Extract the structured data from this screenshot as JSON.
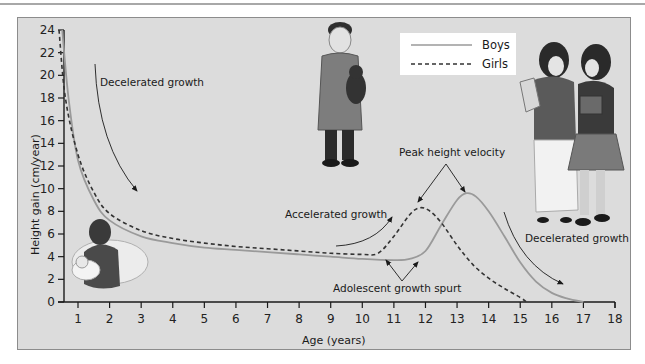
{
  "chart_data": {
    "type": "line",
    "title": "",
    "xlabel": "Age (years)",
    "ylabel": "Height gain (cm/year)",
    "xlim": [
      0.5,
      18
    ],
    "ylim": [
      0,
      24
    ],
    "x_ticks": [
      1,
      2,
      3,
      4,
      5,
      6,
      7,
      8,
      9,
      10,
      11,
      12,
      13,
      14,
      15,
      16,
      17,
      18
    ],
    "y_ticks": [
      0,
      2,
      4,
      6,
      8,
      10,
      12,
      14,
      16,
      18,
      20,
      22,
      24
    ],
    "grid": false,
    "legend": {
      "position": "upper-right-center",
      "entries": [
        {
          "label": "Boys",
          "style": "solid",
          "color": "#9a9a9a"
        },
        {
          "label": "Girls",
          "style": "dashed",
          "color": "#333333"
        }
      ]
    },
    "series": [
      {
        "name": "Boys",
        "style": "solid",
        "x": [
          0.5,
          0.7,
          1.0,
          1.5,
          2.0,
          3.0,
          4.0,
          5.0,
          6.0,
          7.0,
          8.0,
          9.0,
          10.0,
          11.0,
          11.5,
          12.0,
          12.5,
          13.0,
          13.3,
          13.6,
          14.0,
          14.5,
          15.0,
          15.5,
          16.0,
          16.5,
          17.0
        ],
        "y": [
          24,
          18,
          12.5,
          9.0,
          7.2,
          5.8,
          5.2,
          4.8,
          4.6,
          4.4,
          4.2,
          4.0,
          3.8,
          3.7,
          3.8,
          4.5,
          6.8,
          9.0,
          9.6,
          9.3,
          8.0,
          5.8,
          3.5,
          1.8,
          0.8,
          0.3,
          0.0
        ]
      },
      {
        "name": "Girls",
        "style": "dashed",
        "x": [
          0.4,
          0.6,
          1.0,
          1.5,
          2.0,
          3.0,
          4.0,
          5.0,
          6.0,
          7.0,
          8.0,
          9.0,
          10.0,
          10.5,
          11.0,
          11.5,
          11.8,
          12.1,
          12.5,
          13.0,
          13.5,
          14.0,
          14.5,
          15.0,
          15.2
        ],
        "y": [
          24,
          18,
          13.0,
          9.7,
          7.8,
          6.3,
          5.6,
          5.2,
          4.9,
          4.7,
          4.5,
          4.3,
          4.2,
          4.3,
          5.8,
          7.7,
          8.3,
          8.1,
          7.0,
          5.0,
          3.3,
          2.1,
          1.2,
          0.4,
          0.0
        ]
      }
    ],
    "annotations": [
      {
        "text": "Decelerated growth",
        "x": 1.7,
        "y": 20
      },
      {
        "text": "Accelerated growth",
        "x": 9.8,
        "y": 6.5
      },
      {
        "text": "Peak height velocity",
        "x": 11.7,
        "y": 10.5
      },
      {
        "text": "Adolescent growth spurt",
        "x": 10.0,
        "y": 1.2
      },
      {
        "text": "Decelerated growth",
        "x": 14.8,
        "y": 4.2
      }
    ]
  },
  "labels": {
    "xlabel": "Age (years)",
    "ylabel": "Height gain (cm/year)",
    "legend_boys": "Boys",
    "legend_girls": "Girls",
    "anno_decel_early": "Decelerated growth",
    "anno_accel": "Accelerated growth",
    "anno_peak": "Peak height velocity",
    "anno_spurt": "Adolescent growth spurt",
    "anno_decel_late": "Decelerated growth"
  },
  "ticks": {
    "x": [
      "1",
      "2",
      "3",
      "4",
      "5",
      "6",
      "7",
      "8",
      "9",
      "10",
      "11",
      "12",
      "13",
      "14",
      "15",
      "16",
      "17",
      "18"
    ],
    "y": [
      "0",
      "2",
      "4",
      "6",
      "8",
      "10",
      "12",
      "14",
      "16",
      "18",
      "20",
      "22",
      "24"
    ]
  },
  "illustrations": [
    {
      "name": "mother-with-infant",
      "description": "Mother cradling an infant"
    },
    {
      "name": "boy-with-teddy-bear",
      "description": "Boy in robe holding a teddy bear"
    },
    {
      "name": "two-teenage-girls",
      "description": "Two adolescent girls carrying books"
    }
  ],
  "colors": {
    "background": "#dcdcdc",
    "boys_line": "#9a9a9a",
    "girls_line": "#333333",
    "axis": "#1a1a1a"
  }
}
